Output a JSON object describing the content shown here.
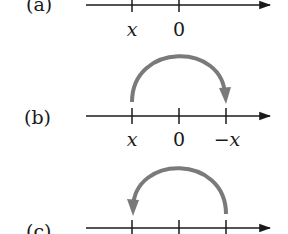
{
  "colors": {
    "axis": "#1a1a1a",
    "arc": "#7a7a7a",
    "background": "#ffffff"
  },
  "panels": [
    {
      "label": "(a)",
      "tick_labels": [
        "x",
        "0"
      ]
    },
    {
      "label": "(b)",
      "tick_labels": [
        "x",
        "0",
        "−x"
      ],
      "arc": "from x to −x (clockwise over 0)"
    },
    {
      "label": "(c)",
      "tick_labels": [],
      "arc": "from −x back to x (counterclockwise over 0)"
    }
  ]
}
